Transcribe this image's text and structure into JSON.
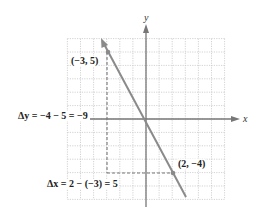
{
  "diagram": {
    "type": "coordinate-plane-slope",
    "axes": {
      "x_label": "x",
      "y_label": "y",
      "x_range": [
        -6,
        6
      ],
      "y_range": [
        -6,
        6
      ],
      "grid": true
    },
    "points": [
      {
        "label": "(−3, 5)",
        "x": -3,
        "y": 5
      },
      {
        "label": "(2, −4)",
        "x": 2,
        "y": -4
      }
    ],
    "line": {
      "through": [
        [
          -3,
          5
        ],
        [
          2,
          -4
        ]
      ],
      "color": "#8a8a8a"
    },
    "annotations": {
      "delta_y": "Δy = −4 − 5 = −9",
      "delta_x": "Δx = 2 − (−3) = 5"
    },
    "colors": {
      "grid": "#c8c8c8",
      "axis": "#777777",
      "line": "#8a8a8a",
      "dashed": "#777777",
      "text": "#222222"
    }
  }
}
